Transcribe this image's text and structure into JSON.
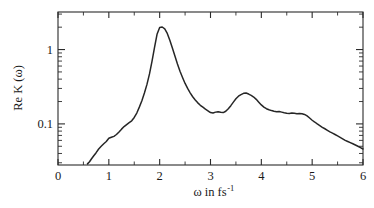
{
  "chart_data": {
    "type": "line",
    "title": "",
    "subtitle": "",
    "xlabel": "ω in fs",
    "xlabel_sup": "-1",
    "ylabel": "Re K (ω)",
    "xscale": "linear",
    "yscale": "log",
    "xlim": [
      0,
      6
    ],
    "ylim": [
      0.028,
      3.2
    ],
    "grid": false,
    "legend": null,
    "xticks": [
      0,
      1,
      2,
      3,
      4,
      5,
      6
    ],
    "xticklabels": [
      "0",
      "1",
      "2",
      "3",
      "4",
      "5",
      "6"
    ],
    "xminorticks": [
      0.5,
      1.5,
      2.5,
      3.5,
      4.5,
      5.5
    ],
    "yticks": [
      0.1,
      1
    ],
    "yticklabels": [
      "0.1",
      "1"
    ],
    "yminorticks": [
      0.03,
      0.04,
      0.05,
      0.06,
      0.07,
      0.08,
      0.09,
      0.2,
      0.3,
      0.4,
      0.5,
      0.6,
      0.7,
      0.8,
      0.9,
      2,
      3
    ],
    "series": [
      {
        "name": "Re K (ω)",
        "color": "#262626",
        "x": [
          0.58,
          0.62,
          0.66,
          0.7,
          0.75,
          0.8,
          0.85,
          0.9,
          0.95,
          1.0,
          1.05,
          1.1,
          1.15,
          1.2,
          1.25,
          1.3,
          1.35,
          1.4,
          1.45,
          1.5,
          1.55,
          1.6,
          1.65,
          1.7,
          1.75,
          1.8,
          1.85,
          1.9,
          1.95,
          2.0,
          2.05,
          2.1,
          2.15,
          2.2,
          2.25,
          2.3,
          2.35,
          2.4,
          2.45,
          2.5,
          2.55,
          2.6,
          2.65,
          2.7,
          2.75,
          2.8,
          2.85,
          2.9,
          2.95,
          3.0,
          3.05,
          3.1,
          3.15,
          3.2,
          3.25,
          3.3,
          3.35,
          3.4,
          3.45,
          3.5,
          3.55,
          3.6,
          3.65,
          3.7,
          3.75,
          3.8,
          3.85,
          3.9,
          3.95,
          4.0,
          4.05,
          4.1,
          4.15,
          4.2,
          4.25,
          4.3,
          4.35,
          4.4,
          4.45,
          4.5,
          4.55,
          4.6,
          4.65,
          4.7,
          4.75,
          4.8,
          4.85,
          4.9,
          4.95,
          5.0,
          5.05,
          5.1,
          5.15,
          5.2,
          5.25,
          5.3,
          5.35,
          5.4,
          5.45,
          5.5,
          5.55,
          5.6,
          5.65,
          5.7,
          5.75,
          5.8,
          5.85,
          5.9,
          5.95,
          6.0
        ],
        "y": [
          0.029,
          0.031,
          0.034,
          0.037,
          0.041,
          0.046,
          0.05,
          0.054,
          0.058,
          0.064,
          0.066,
          0.068,
          0.072,
          0.078,
          0.085,
          0.092,
          0.098,
          0.104,
          0.11,
          0.122,
          0.14,
          0.168,
          0.205,
          0.26,
          0.34,
          0.47,
          0.7,
          1.08,
          1.62,
          1.98,
          2.01,
          1.9,
          1.65,
          1.33,
          1.05,
          0.82,
          0.64,
          0.51,
          0.42,
          0.35,
          0.3,
          0.262,
          0.232,
          0.21,
          0.192,
          0.178,
          0.168,
          0.158,
          0.15,
          0.142,
          0.14,
          0.144,
          0.146,
          0.143,
          0.142,
          0.148,
          0.16,
          0.176,
          0.196,
          0.218,
          0.236,
          0.248,
          0.258,
          0.26,
          0.252,
          0.242,
          0.23,
          0.214,
          0.196,
          0.18,
          0.168,
          0.16,
          0.155,
          0.151,
          0.148,
          0.146,
          0.147,
          0.144,
          0.141,
          0.139,
          0.138,
          0.14,
          0.139,
          0.137,
          0.138,
          0.137,
          0.134,
          0.128,
          0.12,
          0.112,
          0.106,
          0.1,
          0.095,
          0.09,
          0.086,
          0.082,
          0.078,
          0.075,
          0.072,
          0.069,
          0.066,
          0.063,
          0.06,
          0.058,
          0.056,
          0.054,
          0.052,
          0.05,
          0.048,
          0.046
        ],
        "annotations": [
          {
            "label": "main peak",
            "x": 2.0,
            "y": 2.0
          },
          {
            "label": "local minimum",
            "x": 3.0,
            "y": 0.14
          },
          {
            "label": "secondary peak",
            "x": 3.68,
            "y": 0.26
          },
          {
            "label": "plateau",
            "x": 4.5,
            "y": 0.139
          }
        ]
      }
    ]
  },
  "figure": {
    "background_color": "#ffffff",
    "axis_color": "#2b2b2b",
    "curve_color": "#262626"
  }
}
